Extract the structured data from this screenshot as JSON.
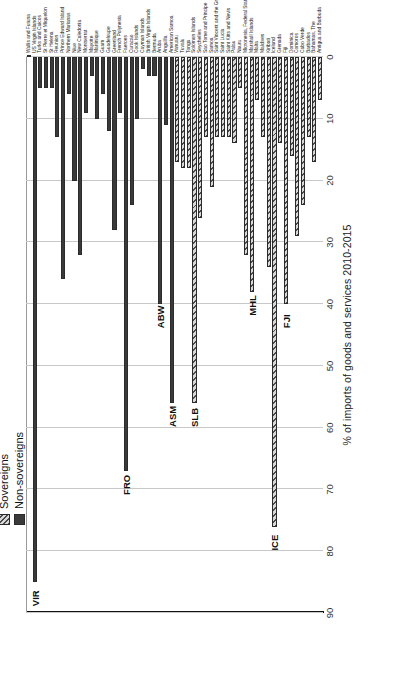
{
  "chart_data": {
    "type": "bar",
    "orientation": "horizontal",
    "title": "",
    "xlabel": "",
    "ylabel": "% of imports of goods and services 2010-2015",
    "ylim": [
      0,
      90
    ],
    "yticks": [
      0,
      10,
      20,
      30,
      40,
      50,
      60,
      70,
      80,
      90
    ],
    "grid": true,
    "reference_line": 40,
    "legend_position": "top-left",
    "legend": [
      {
        "name": "Sovereigns",
        "pattern": "hatched",
        "color": "#d8d8d8"
      },
      {
        "name": "Non-sovereigns",
        "pattern": "solid",
        "color": "#3a3a3a"
      }
    ],
    "categories": [
      "Antigua and Barbuda",
      "Bahamas, The",
      "Barbados",
      "Cabo Verde",
      "Comoros",
      "Dominica",
      "Fiji",
      "Grenada",
      "Iceland",
      "Kiribati",
      "Maldives",
      "Malta",
      "Marshall Islands",
      "Micronesia, Federal States of",
      "Nauru",
      "Palau",
      "Saint Kitts and Nevis",
      "Saint Lucia",
      "Saint Vincent and the Grenadines",
      "Samoa",
      "Sao Tome and Principe",
      "Seychelles",
      "Solomon Islands",
      "Tonga",
      "Tuvalu",
      "Vanuatu",
      "American Samoa",
      "Anguilla",
      "Aruba",
      "Bermuda",
      "British Virgin Islands",
      "Cayman Islands",
      "Cook Islands",
      "Curacao",
      "Faeroes",
      "French Polynesia",
      "Greenland",
      "Guadeloupe",
      "Guam",
      "Martinique",
      "Mayotte",
      "Montserrat",
      "New Caledonia",
      "Niue",
      "Northern Marianas",
      "Prince Edward Island",
      "Reunion",
      "St Helena",
      "St Pierre et Miquelon",
      "Turks and Caicos",
      "US Virgin Islands",
      "Wallis and Futuna"
    ],
    "series": [
      {
        "name": "Sovereigns",
        "values": [
          7,
          17,
          13,
          24,
          29,
          16,
          40,
          14,
          76,
          34,
          13,
          7,
          38,
          32,
          5,
          14,
          13,
          13,
          13,
          21,
          13,
          26,
          56,
          18,
          18,
          17,
          null,
          null,
          null,
          null,
          null,
          null,
          null,
          null,
          null,
          null,
          null,
          null,
          null,
          null,
          null,
          null,
          null,
          null,
          null,
          null,
          null,
          null,
          null,
          null,
          null,
          null
        ]
      },
      {
        "name": "Non-sovereigns",
        "values": [
          null,
          null,
          null,
          null,
          null,
          null,
          null,
          null,
          null,
          null,
          null,
          null,
          null,
          null,
          null,
          null,
          null,
          null,
          null,
          null,
          null,
          null,
          null,
          null,
          null,
          null,
          56,
          11,
          40,
          3,
          3,
          2,
          10,
          24,
          67,
          9,
          28,
          12,
          6,
          10,
          3,
          9,
          32,
          20,
          6,
          36,
          13,
          5,
          5,
          5,
          85,
          0
        ]
      }
    ],
    "annotations": [
      {
        "code": "FJI",
        "category": "Fiji",
        "value": 40
      },
      {
        "code": "ICE",
        "category": "Iceland",
        "value": 76
      },
      {
        "code": "MHL",
        "category": "Marshall Islands",
        "value": 38
      },
      {
        "code": "SLB",
        "category": "Solomon Islands",
        "value": 56
      },
      {
        "code": "ASM",
        "category": "American Samoa",
        "value": 56
      },
      {
        "code": "ABW",
        "category": "Aruba",
        "value": 40
      },
      {
        "code": "FRO",
        "category": "Faeroes",
        "value": 67
      },
      {
        "code": "VIR",
        "category": "US Virgin Islands",
        "value": 85
      }
    ]
  },
  "axis": {
    "title": "% of imports of goods and services 2010-2015",
    "tick_labels": [
      "0",
      "10",
      "20",
      "30",
      "40",
      "50",
      "60",
      "70",
      "80",
      "90"
    ]
  },
  "legend": {
    "sovereigns_label": "Sovereigns",
    "nonsovereigns_label": "Non-sovereigns"
  }
}
